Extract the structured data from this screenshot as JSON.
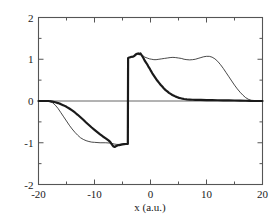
{
  "chart_data": {
    "type": "line",
    "title": "",
    "xlabel": "x (a.u.)",
    "ylabel": "",
    "xlim": [
      -20,
      20
    ],
    "ylim": [
      -2,
      2
    ],
    "xticks": [
      -20,
      -10,
      0,
      10,
      20
    ],
    "xtick_labels": [
      "-20",
      "-10",
      "0",
      "10",
      "20"
    ],
    "yticks": [
      -2,
      -1,
      0,
      1,
      2
    ],
    "ytick_labels": [
      "-2",
      "-1",
      "0",
      "1",
      "2"
    ],
    "x_minor_ticks": [
      -15,
      -5,
      5,
      15
    ],
    "y_minor_ticks": [
      -1.5,
      -0.5,
      0.5,
      1.5
    ],
    "grid": false,
    "legend": null,
    "zero_line": 0,
    "annotations": [
      "sharp vertical discontinuity at x = -4 from y = -1 to y = +1",
      "both curves are flat at y = 0 outside x = -18 .. 18"
    ],
    "series": [
      {
        "name": "thin-curve",
        "style": "thin-solid",
        "color": "#1a1a1a",
        "width": 0.8,
        "points": [
          [
            -20.0,
            0.0
          ],
          [
            -19.0,
            0.0
          ],
          [
            -18.4,
            0.0
          ],
          [
            -18.0,
            -0.01
          ],
          [
            -17.5,
            -0.04
          ],
          [
            -17.0,
            -0.1
          ],
          [
            -16.5,
            -0.18
          ],
          [
            -16.0,
            -0.28
          ],
          [
            -15.5,
            -0.38
          ],
          [
            -15.0,
            -0.48
          ],
          [
            -14.5,
            -0.58
          ],
          [
            -14.0,
            -0.67
          ],
          [
            -13.5,
            -0.75
          ],
          [
            -13.0,
            -0.82
          ],
          [
            -12.5,
            -0.88
          ],
          [
            -12.0,
            -0.92
          ],
          [
            -11.5,
            -0.95
          ],
          [
            -11.0,
            -0.97
          ],
          [
            -10.5,
            -0.985
          ],
          [
            -10.0,
            -0.99
          ],
          [
            -9.0,
            -1.0
          ],
          [
            -8.0,
            -1.0
          ],
          [
            -7.0,
            -1.01
          ],
          [
            -6.5,
            -1.03
          ],
          [
            -6.0,
            -1.04
          ],
          [
            -5.5,
            -1.04
          ],
          [
            -5.0,
            -1.03
          ],
          [
            -4.5,
            -1.02
          ],
          [
            -4.05,
            -1.02
          ],
          [
            -4.0,
            1.03
          ],
          [
            -3.8,
            1.04
          ],
          [
            -3.5,
            1.05
          ],
          [
            -3.2,
            1.05
          ],
          [
            -3.0,
            1.06
          ],
          [
            -2.7,
            1.08
          ],
          [
            -2.5,
            1.11
          ],
          [
            -2.2,
            1.13
          ],
          [
            -2.0,
            1.12
          ],
          [
            -1.8,
            1.14
          ],
          [
            -1.6,
            1.11
          ],
          [
            -1.4,
            1.09
          ],
          [
            -1.2,
            1.07
          ],
          [
            -1.0,
            1.05
          ],
          [
            -0.6,
            1.03
          ],
          [
            -0.2,
            1.01
          ],
          [
            0.2,
            1.0
          ],
          [
            0.6,
            0.99
          ],
          [
            1.0,
            0.99
          ],
          [
            1.5,
            1.0
          ],
          [
            2.0,
            1.01
          ],
          [
            2.5,
            1.02
          ],
          [
            3.0,
            1.03
          ],
          [
            3.5,
            1.04
          ],
          [
            4.0,
            1.045
          ],
          [
            4.5,
            1.04
          ],
          [
            5.0,
            1.03
          ],
          [
            5.5,
            1.02
          ],
          [
            6.0,
            1.0
          ],
          [
            6.5,
            0.99
          ],
          [
            7.0,
            0.985
          ],
          [
            7.5,
            0.99
          ],
          [
            8.0,
            1.0
          ],
          [
            8.5,
            1.02
          ],
          [
            9.0,
            1.04
          ],
          [
            9.5,
            1.06
          ],
          [
            10.0,
            1.07
          ],
          [
            10.5,
            1.07
          ],
          [
            11.0,
            1.05
          ],
          [
            11.5,
            1.01
          ],
          [
            12.0,
            0.95
          ],
          [
            12.5,
            0.87
          ],
          [
            13.0,
            0.78
          ],
          [
            13.5,
            0.68
          ],
          [
            14.0,
            0.58
          ],
          [
            14.5,
            0.48
          ],
          [
            15.0,
            0.38
          ],
          [
            15.5,
            0.29
          ],
          [
            16.0,
            0.21
          ],
          [
            16.5,
            0.14
          ],
          [
            17.0,
            0.08
          ],
          [
            17.5,
            0.04
          ],
          [
            18.0,
            0.01
          ],
          [
            18.5,
            0.0
          ],
          [
            19.5,
            0.0
          ],
          [
            20.0,
            0.0
          ]
        ]
      },
      {
        "name": "thick-noisy-curve",
        "style": "thick-solid",
        "color": "#1a1a1a",
        "width": 2.2,
        "points": [
          [
            -20.0,
            0.0
          ],
          [
            -19.0,
            0.0
          ],
          [
            -18.2,
            0.0
          ],
          [
            -18.0,
            -0.005
          ],
          [
            -17.5,
            -0.015
          ],
          [
            -17.0,
            -0.03
          ],
          [
            -16.5,
            -0.05
          ],
          [
            -16.0,
            -0.075
          ],
          [
            -15.5,
            -0.105
          ],
          [
            -15.0,
            -0.14
          ],
          [
            -14.5,
            -0.18
          ],
          [
            -14.0,
            -0.225
          ],
          [
            -13.5,
            -0.275
          ],
          [
            -13.0,
            -0.33
          ],
          [
            -12.5,
            -0.39
          ],
          [
            -12.0,
            -0.45
          ],
          [
            -11.5,
            -0.515
          ],
          [
            -11.0,
            -0.575
          ],
          [
            -10.5,
            -0.635
          ],
          [
            -10.0,
            -0.69
          ],
          [
            -9.5,
            -0.745
          ],
          [
            -9.0,
            -0.8
          ],
          [
            -8.5,
            -0.85
          ],
          [
            -8.0,
            -0.895
          ],
          [
            -7.5,
            -0.945
          ],
          [
            -7.2,
            -0.98
          ],
          [
            -7.0,
            -1.02
          ],
          [
            -6.8,
            -1.06
          ],
          [
            -6.6,
            -1.09
          ],
          [
            -6.4,
            -1.1
          ],
          [
            -6.2,
            -1.085
          ],
          [
            -6.0,
            -1.07
          ],
          [
            -5.8,
            -1.06
          ],
          [
            -5.6,
            -1.055
          ],
          [
            -5.4,
            -1.05
          ],
          [
            -5.2,
            -1.045
          ],
          [
            -5.0,
            -1.04
          ],
          [
            -4.7,
            -1.035
          ],
          [
            -4.4,
            -1.03
          ],
          [
            -4.1,
            -1.03
          ],
          [
            -4.05,
            -1.03
          ],
          [
            -4.0,
            1.03
          ],
          [
            -3.8,
            1.04
          ],
          [
            -3.6,
            1.05
          ],
          [
            -3.4,
            1.06
          ],
          [
            -3.2,
            1.06
          ],
          [
            -3.0,
            1.07
          ],
          [
            -2.8,
            1.09
          ],
          [
            -2.6,
            1.12
          ],
          [
            -2.4,
            1.13
          ],
          [
            -2.2,
            1.14
          ],
          [
            -2.0,
            1.12
          ],
          [
            -1.8,
            1.14
          ],
          [
            -1.6,
            1.1
          ],
          [
            -1.4,
            1.06
          ],
          [
            -1.2,
            1.01
          ],
          [
            -1.0,
            0.96
          ],
          [
            -0.8,
            0.92
          ],
          [
            -0.6,
            0.88
          ],
          [
            -0.4,
            0.83
          ],
          [
            -0.2,
            0.79
          ],
          [
            0.0,
            0.74
          ],
          [
            0.3,
            0.67
          ],
          [
            0.6,
            0.61
          ],
          [
            0.9,
            0.55
          ],
          [
            1.2,
            0.49
          ],
          [
            1.5,
            0.44
          ],
          [
            1.8,
            0.39
          ],
          [
            2.1,
            0.345
          ],
          [
            2.4,
            0.3
          ],
          [
            2.7,
            0.26
          ],
          [
            3.0,
            0.23
          ],
          [
            3.3,
            0.195
          ],
          [
            3.6,
            0.17
          ],
          [
            3.9,
            0.145
          ],
          [
            4.2,
            0.125
          ],
          [
            4.5,
            0.105
          ],
          [
            4.8,
            0.09
          ],
          [
            5.1,
            0.075
          ],
          [
            5.4,
            0.065
          ],
          [
            5.7,
            0.055
          ],
          [
            6.0,
            0.048
          ],
          [
            6.5,
            0.04
          ],
          [
            7.0,
            0.035
          ],
          [
            7.5,
            0.03
          ],
          [
            8.0,
            0.028
          ],
          [
            9.0,
            0.025
          ],
          [
            10.0,
            0.022
          ],
          [
            11.0,
            0.02
          ],
          [
            12.0,
            0.018
          ],
          [
            13.0,
            0.016
          ],
          [
            14.0,
            0.014
          ],
          [
            15.0,
            0.012
          ],
          [
            16.0,
            0.01
          ],
          [
            17.0,
            0.006
          ],
          [
            17.8,
            0.002
          ],
          [
            18.5,
            0.0
          ],
          [
            19.5,
            0.0
          ],
          [
            20.0,
            0.0
          ]
        ]
      }
    ]
  },
  "axes": {
    "frame_color": "#555555",
    "zero_line_color": "#666666"
  }
}
